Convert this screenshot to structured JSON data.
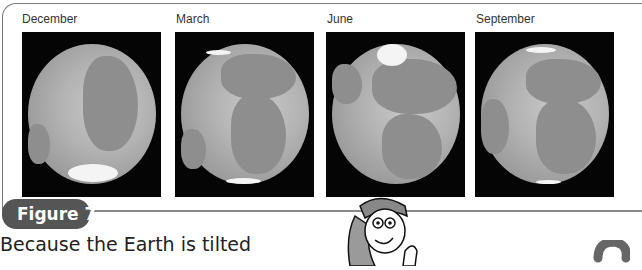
{
  "figure": {
    "label": "Figure 7",
    "panels": [
      {
        "label": "December",
        "image": "globe-december"
      },
      {
        "label": "March",
        "image": "globe-march"
      },
      {
        "label": "June",
        "image": "globe-june"
      },
      {
        "label": "September",
        "image": "globe-september"
      }
    ]
  },
  "body": {
    "text": "Because the Earth is tilted"
  },
  "illustrations": {
    "cartoon": "cartoon-girl-character",
    "question_mark": "question-mark-icon"
  }
}
